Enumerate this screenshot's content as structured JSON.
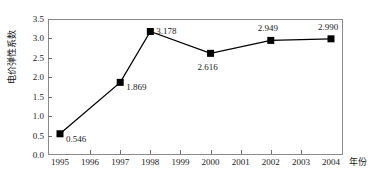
{
  "chart_data": {
    "type": "line",
    "title": "",
    "subtitle": "",
    "xlabel": "年份",
    "ylabel": "电价弹性系数",
    "xlim": [
      1995,
      2004
    ],
    "ylim": [
      0.0,
      3.5
    ],
    "grid": false,
    "legend": "none",
    "marker": "filled-square",
    "line_color": "#000000",
    "marker_color": "#000000",
    "frame_color": "#8a8a8a",
    "x_tick_labels": [
      "1995",
      "1996",
      "1997",
      "1998",
      "1999",
      "2000",
      "2001",
      "2002",
      "2003",
      "2004"
    ],
    "y_tick_labels": [
      "0.0",
      "0.5",
      "1.0",
      "1.5",
      "2.0",
      "2.5",
      "3.0",
      "3.5"
    ],
    "x": [
      1995,
      1997,
      1998,
      2000,
      2002,
      2004
    ],
    "values": [
      0.546,
      1.869,
      3.178,
      2.616,
      2.949,
      2.99
    ],
    "point_labels": [
      {
        "x": 1995,
        "y": 0.546,
        "text": "0.546",
        "position": "right-below"
      },
      {
        "x": 1997,
        "y": 1.869,
        "text": "1.869",
        "position": "right-below"
      },
      {
        "x": 1998,
        "y": 3.178,
        "text": "3.178",
        "position": "right"
      },
      {
        "x": 2000,
        "y": 2.616,
        "text": "2.616",
        "position": "below"
      },
      {
        "x": 2002,
        "y": 2.949,
        "text": "2.949",
        "position": "above"
      },
      {
        "x": 2004,
        "y": 2.99,
        "text": "2.990",
        "position": "above"
      }
    ]
  }
}
